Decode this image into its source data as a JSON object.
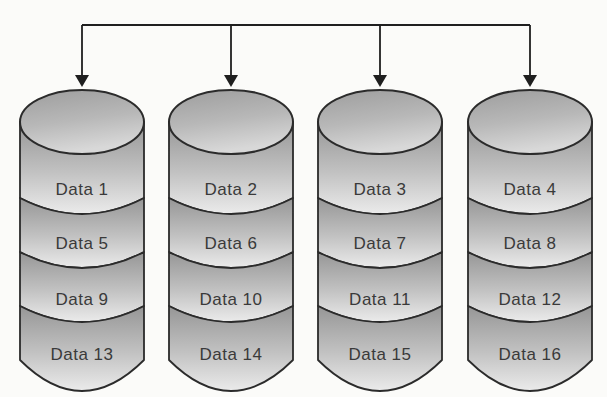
{
  "diagram": {
    "connector": {
      "arrow_count": 4
    },
    "cylinders": [
      {
        "name": "cylinder-1",
        "segments": [
          "Data 1",
          "Data 5",
          "Data 9",
          "Data 13"
        ]
      },
      {
        "name": "cylinder-2",
        "segments": [
          "Data 2",
          "Data 6",
          "Data 10",
          "Data 14"
        ]
      },
      {
        "name": "cylinder-3",
        "segments": [
          "Data 3",
          "Data 7",
          "Data 11",
          "Data 15"
        ]
      },
      {
        "name": "cylinder-4",
        "segments": [
          "Data 4",
          "Data 8",
          "Data 12",
          "Data 16"
        ]
      }
    ],
    "colors": {
      "background": "#fbfbf9",
      "outline": "#2b2b2b",
      "arrow": "#1f1f1f",
      "text": "#3a3a3a",
      "band_top": "#969696",
      "band_mid": "#c2c2c2",
      "band_bottom": "#ebebeb",
      "ellipse_top": "#9d9d9d",
      "ellipse_mid": "#b8b8b8",
      "ellipse_bottom": "#d8d8d8"
    }
  }
}
